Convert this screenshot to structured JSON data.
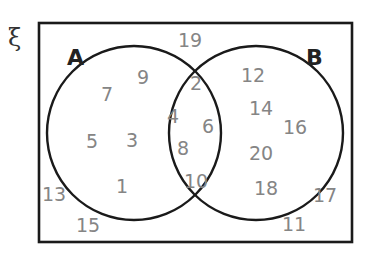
{
  "diagram": {
    "type": "venn",
    "universal_symbol": "ξ",
    "sets": [
      {
        "label": "A"
      },
      {
        "label": "B"
      }
    ],
    "regions": {
      "only_A": [
        "7",
        "9",
        "5",
        "3",
        "1"
      ],
      "A_and_B": [
        "2",
        "4",
        "6",
        "8",
        "10"
      ],
      "only_B": [
        "12",
        "14",
        "16",
        "20",
        "18"
      ],
      "outside": [
        "19",
        "13",
        "15",
        "17",
        "11"
      ]
    },
    "colors": {
      "outline": "#1a1a1a",
      "numbers": "#858585",
      "labels": "#222222"
    }
  },
  "numbers": {
    "n19": "19",
    "n7": "7",
    "n9": "9",
    "n2": "2",
    "n12": "12",
    "n14": "14",
    "n16": "16",
    "n4": "4",
    "n6": "6",
    "n5": "5",
    "n3": "3",
    "n8": "8",
    "n20": "20",
    "n10": "10",
    "n1": "1",
    "n18": "18",
    "n13": "13",
    "n17": "17",
    "n15": "15",
    "n11": "11"
  },
  "labels": {
    "xi": "ξ",
    "a": "A",
    "b": "B"
  }
}
